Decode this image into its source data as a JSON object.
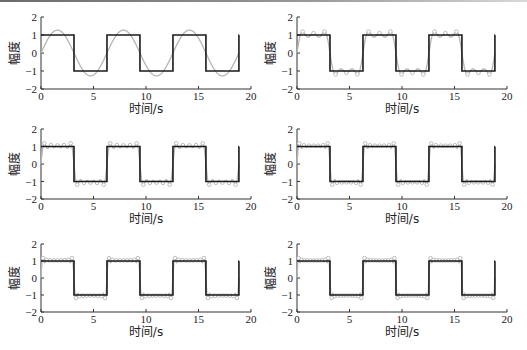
{
  "figure": {
    "background": "#ffffff",
    "colors": {
      "square": "#1a1a1a",
      "approx": "#b5b5b5",
      "axis": "#333333"
    }
  },
  "chart_data": [
    {
      "type": "line",
      "panel": 1,
      "xlabel": "时间/s",
      "ylabel": "幅度",
      "xlim": [
        0,
        20
      ],
      "ylim": [
        -2,
        2
      ],
      "xticks": [
        0,
        5,
        10,
        15,
        20
      ],
      "yticks": [
        -2,
        -1,
        0,
        1,
        2
      ],
      "grid": false,
      "series": [
        {
          "name": "square wave",
          "x_range": [
            0,
            18.85
          ],
          "period": 6.2832,
          "amplitude": 1
        },
        {
          "name": "Fourier approximation",
          "harmonics": 1,
          "x_range": [
            0,
            18.85
          ]
        }
      ]
    },
    {
      "type": "line",
      "panel": 2,
      "xlabel": "时间/s",
      "ylabel": "幅度",
      "xlim": [
        0,
        20
      ],
      "ylim": [
        -2,
        2
      ],
      "xticks": [
        0,
        5,
        10,
        15,
        20
      ],
      "yticks": [
        -2,
        -1,
        0,
        1,
        2
      ],
      "grid": false,
      "series": [
        {
          "name": "square wave",
          "x_range": [
            0,
            18.85
          ],
          "period": 6.2832,
          "amplitude": 1
        },
        {
          "name": "Fourier approximation",
          "harmonics": 3,
          "x_range": [
            0,
            18.85
          ]
        }
      ]
    },
    {
      "type": "line",
      "panel": 3,
      "xlabel": "时间/s",
      "ylabel": "幅度",
      "xlim": [
        0,
        20
      ],
      "ylim": [
        -2,
        2
      ],
      "xticks": [
        0,
        5,
        10,
        15,
        20
      ],
      "yticks": [
        -2,
        -1,
        0,
        1,
        2
      ],
      "grid": false,
      "series": [
        {
          "name": "square wave",
          "x_range": [
            0,
            18.85
          ],
          "period": 6.2832,
          "amplitude": 1
        },
        {
          "name": "Fourier approximation",
          "harmonics": 5,
          "x_range": [
            0,
            18.85
          ]
        }
      ]
    },
    {
      "type": "line",
      "panel": 4,
      "xlabel": "时间/s",
      "ylabel": "幅度",
      "xlim": [
        0,
        20
      ],
      "ylim": [
        -2,
        2
      ],
      "xticks": [
        0,
        5,
        10,
        15,
        20
      ],
      "yticks": [
        -2,
        -1,
        0,
        1,
        2
      ],
      "grid": false,
      "series": [
        {
          "name": "square wave",
          "x_range": [
            0,
            18.85
          ],
          "period": 6.2832,
          "amplitude": 1
        },
        {
          "name": "Fourier approximation",
          "harmonics": 7,
          "x_range": [
            0,
            18.85
          ]
        }
      ]
    },
    {
      "type": "line",
      "panel": 5,
      "xlabel": "时间/s",
      "ylabel": "幅度",
      "xlim": [
        0,
        20
      ],
      "ylim": [
        -2,
        2
      ],
      "xticks": [
        0,
        5,
        10,
        15,
        20
      ],
      "yticks": [
        -2,
        -1,
        0,
        1,
        2
      ],
      "grid": false,
      "series": [
        {
          "name": "square wave",
          "x_range": [
            0,
            18.85
          ],
          "period": 6.2832,
          "amplitude": 1
        },
        {
          "name": "Fourier approximation",
          "harmonics": 9,
          "x_range": [
            0,
            18.85
          ]
        }
      ]
    },
    {
      "type": "line",
      "panel": 6,
      "xlabel": "时间/s",
      "ylabel": "幅度",
      "xlim": [
        0,
        20
      ],
      "ylim": [
        -2,
        2
      ],
      "xticks": [
        0,
        5,
        10,
        15,
        20
      ],
      "yticks": [
        -2,
        -1,
        0,
        1,
        2
      ],
      "grid": false,
      "series": [
        {
          "name": "square wave",
          "x_range": [
            0,
            18.85
          ],
          "period": 6.2832,
          "amplitude": 1
        },
        {
          "name": "Fourier approximation",
          "harmonics": 11,
          "x_range": [
            0,
            18.85
          ]
        }
      ]
    }
  ],
  "layout": {
    "panels": [
      {
        "x0": 41,
        "x20": 251,
        "yTop": 17,
        "yBot": 89
      },
      {
        "x0": 297,
        "x20": 507,
        "yTop": 17,
        "yBot": 89
      },
      {
        "x0": 41,
        "x20": 251,
        "yTop": 129,
        "yBot": 199
      },
      {
        "x0": 297,
        "x20": 507,
        "yTop": 129,
        "yBot": 199
      },
      {
        "x0": 41,
        "x20": 251,
        "yTop": 244,
        "yBot": 312
      },
      {
        "x0": 297,
        "x20": 507,
        "yTop": 244,
        "yBot": 312
      }
    ]
  }
}
